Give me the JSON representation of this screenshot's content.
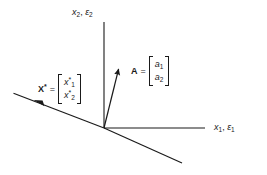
{
  "figure": {
    "name": "vector-diagram-oblique-axes",
    "background_color": "#ffffff",
    "line_color": "#1a1a1a",
    "text_color": "#1a1a1a"
  },
  "axes": {
    "vertical": {
      "name": "x2-axis",
      "label_var": "x",
      "label_var_sub": "2",
      "label_sep": ", ",
      "label_eps": "ε",
      "label_eps_sub": "2",
      "from": [
        104,
        22
      ],
      "to": [
        104,
        128
      ]
    },
    "horizontal": {
      "name": "x1-axis",
      "label_var": "x",
      "label_var_sub": "1",
      "label_sep": ", ",
      "label_eps": "ε",
      "label_eps_sub": "1",
      "from": [
        104,
        128
      ],
      "to": [
        205,
        128
      ]
    },
    "oblique": {
      "name": "oblique-axis",
      "from": [
        13,
        93
      ],
      "to": [
        182,
        163
      ],
      "arrow_at": [
        38,
        102
      ]
    }
  },
  "vectors": {
    "A": {
      "name": "vector-A",
      "label": "A",
      "equals": "=",
      "components": [
        "a",
        "a"
      ],
      "component_subs": [
        "1",
        "2"
      ],
      "from": [
        104,
        128
      ],
      "to": [
        119,
        67
      ]
    },
    "Xstar": {
      "name": "vector-X-star",
      "label": "X",
      "label_star": "*",
      "equals": "=",
      "components": [
        "x",
        "x"
      ],
      "component_subs": [
        "1",
        "2"
      ],
      "component_star": "*"
    }
  }
}
